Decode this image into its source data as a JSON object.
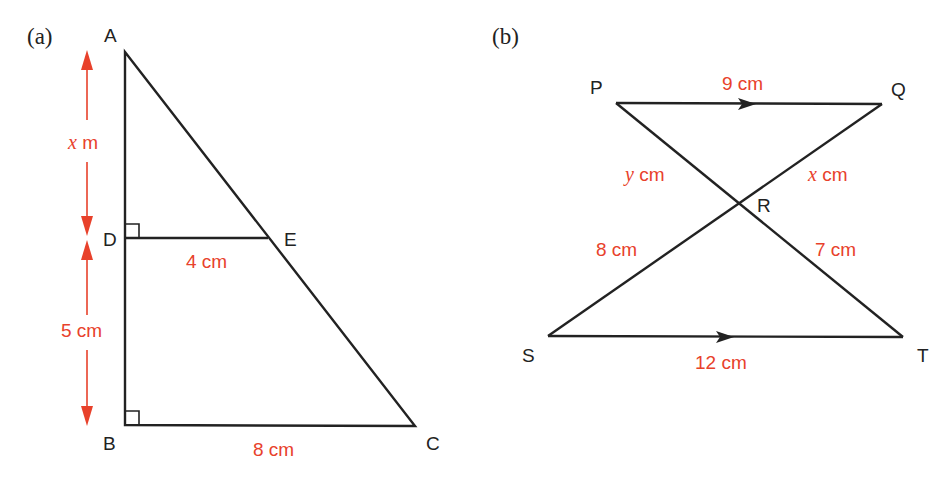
{
  "colors": {
    "line": "#222222",
    "measure": "#e8412b",
    "background": "#ffffff"
  },
  "figure_a": {
    "tag": "(a)",
    "points": {
      "A": "A",
      "B": "B",
      "C": "C",
      "D": "D",
      "E": "E"
    },
    "measurements": {
      "AD_var": "x",
      "AD_unit": "m",
      "DB": "5 cm",
      "DE": "4 cm",
      "BC": "8 cm"
    },
    "right_angles": [
      "D",
      "B"
    ]
  },
  "figure_b": {
    "tag": "(b)",
    "points": {
      "P": "P",
      "Q": "Q",
      "R": "R",
      "S": "S",
      "T": "T"
    },
    "measurements": {
      "PQ": "9 cm",
      "PR_var": "y",
      "PR_unit": "cm",
      "QR_var": "x",
      "QR_unit": "cm",
      "SR": "8 cm",
      "RT": "7 cm",
      "ST": "12 cm"
    },
    "parallel_marks": [
      "PQ",
      "ST"
    ]
  }
}
